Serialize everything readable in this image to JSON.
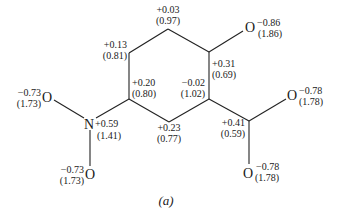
{
  "figure": {
    "caption": "(a)",
    "bond_color": "#222222",
    "text_color": "#1a1a1a"
  },
  "ring": {
    "top": {
      "charge": "+0.03",
      "pop": "(0.97)"
    },
    "upper_left": {
      "charge": "+0.13",
      "pop": "(0.81)"
    },
    "upper_right": {
      "charge": "+0.31",
      "pop": "(0.69)"
    },
    "lower_left": {
      "charge": "+0.20",
      "pop": "(0.80)"
    },
    "lower_right": {
      "charge": "−0.02",
      "pop": "(1.02)"
    },
    "bottom": {
      "charge": "+0.23",
      "pop": "(0.77)"
    }
  },
  "hydroxyl_oxygen": {
    "symbol": "O",
    "charge": "−0.86",
    "pop": "(1.86)"
  },
  "nitro": {
    "nitrogen": {
      "symbol": "N",
      "charge": "+0.59",
      "pop": "(1.41)"
    },
    "oxygen_upper": {
      "symbol": "O",
      "charge": "−0.73",
      "pop": "(1.73)"
    },
    "oxygen_lower": {
      "symbol": "O",
      "charge": "−0.73",
      "pop": "(1.73)"
    }
  },
  "carboxylate": {
    "carbon": {
      "charge": "+0.41",
      "pop": "(0.59)"
    },
    "oxygen_right": {
      "symbol": "O",
      "charge": "−0.78",
      "pop": "(1.78)"
    },
    "oxygen_bottom": {
      "symbol": "O",
      "charge": "−0.78",
      "pop": "(1.78)"
    }
  }
}
